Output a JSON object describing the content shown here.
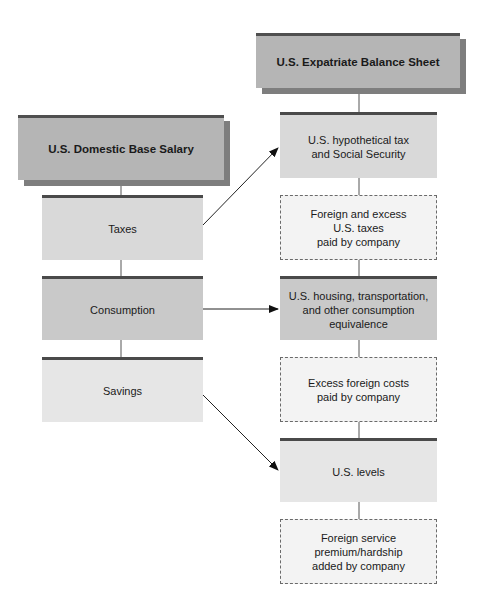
{
  "left_column": {
    "header": "U.S. Domestic Base Salary",
    "items": [
      {
        "label": "Taxes"
      },
      {
        "label": "Consumption"
      },
      {
        "label": "Savings"
      }
    ]
  },
  "right_column": {
    "header": "U.S. Expatriate Balance Sheet",
    "items": [
      {
        "label": "U.S. hypothetical tax\nand Social Security",
        "style": "solid"
      },
      {
        "label": "Foreign and excess\nU.S. taxes\npaid by company",
        "style": "dashed"
      },
      {
        "label": "U.S. housing, transportation,\nand other consumption\nequivalence",
        "style": "solid"
      },
      {
        "label": "Excess foreign costs\npaid by company",
        "style": "dashed"
      },
      {
        "label": "U.S. levels",
        "style": "solid"
      },
      {
        "label": "Foreign service\npremium/hardship\nadded by company",
        "style": "dashed"
      }
    ]
  },
  "arrows": [
    {
      "from": "Taxes",
      "to": "U.S. hypothetical tax and Social Security"
    },
    {
      "from": "Consumption",
      "to": "U.S. housing, transportation, and other consumption equivalence"
    },
    {
      "from": "Savings",
      "to": "U.S. levels"
    }
  ],
  "colors": {
    "header_fill": "#b5b5b5",
    "header_shadow": "#7e7e7e",
    "bar": "#4a4a4a",
    "dashed_fill": "#f3f3f3"
  }
}
